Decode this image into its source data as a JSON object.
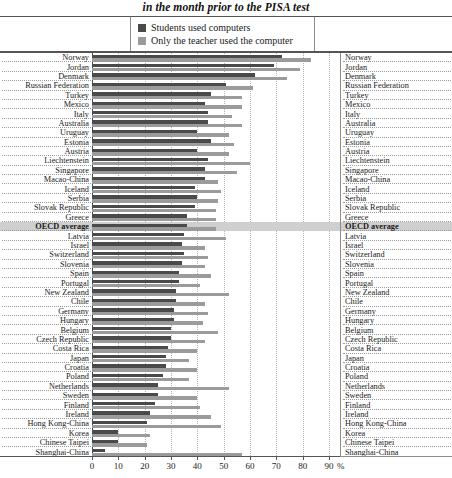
{
  "title": "in the month prior to the PISA test",
  "legend": {
    "items": [
      {
        "label": "Students used computers",
        "color": "#4a4a4a",
        "key": "students"
      },
      {
        "label": "Only the teacher used the computer",
        "color": "#9b9b9b",
        "key": "teacher"
      }
    ]
  },
  "axis": {
    "unit": "%",
    "ticks": [
      "0",
      "10",
      "20",
      "30",
      "40",
      "50",
      "60",
      "70",
      "80",
      "90"
    ]
  },
  "chart_data": {
    "type": "bar",
    "orientation": "horizontal",
    "title": "in the month prior to the PISA test",
    "xlabel": "%",
    "ylabel": "",
    "xlim": [
      0,
      90
    ],
    "grid": true,
    "legend_position": "top-center",
    "categories": [
      "Norway",
      "Jordan",
      "Denmark",
      "Russian Federation",
      "Turkey",
      "Mexico",
      "Italy",
      "Australia",
      "Uruguay",
      "Estonia",
      "Austria",
      "Liechtenstein",
      "Singapore",
      "Macao-China",
      "Iceland",
      "Serbia",
      "Slovak Republic",
      "Greece",
      "OECD average",
      "Latvia",
      "Israel",
      "Switzerland",
      "Slovenia",
      "Spain",
      "Portugal",
      "New Zealand",
      "Chile",
      "Germany",
      "Hungary",
      "Belgium",
      "Czech Republic",
      "Costa Rica",
      "Japan",
      "Croatia",
      "Poland",
      "Netherlands",
      "Sweden",
      "Finland",
      "Ireland",
      "Hong Kong-China",
      "Korea",
      "Chinese Taipei",
      "Shanghai-China"
    ],
    "series": [
      {
        "name": "Students used computers",
        "color": "#4a4a4a",
        "values": [
          72,
          69,
          62,
          51,
          45,
          43,
          44,
          44,
          40,
          45,
          40,
          44,
          43,
          43,
          39,
          40,
          39,
          36,
          36,
          35,
          34,
          35,
          34,
          33,
          33,
          32,
          32,
          31,
          31,
          30,
          30,
          29,
          28,
          28,
          27,
          25,
          25,
          24,
          22,
          21,
          10,
          10,
          5
        ]
      },
      {
        "name": "Only the teacher used the computer",
        "color": "#9b9b9b",
        "values": [
          83,
          79,
          74,
          61,
          57,
          57,
          53,
          57,
          52,
          54,
          52,
          60,
          55,
          48,
          49,
          48,
          47,
          47,
          47,
          51,
          43,
          44,
          43,
          45,
          41,
          52,
          43,
          44,
          42,
          48,
          43,
          40,
          37,
          40,
          37,
          52,
          40,
          41,
          45,
          49,
          22,
          21,
          57
        ]
      }
    ]
  }
}
